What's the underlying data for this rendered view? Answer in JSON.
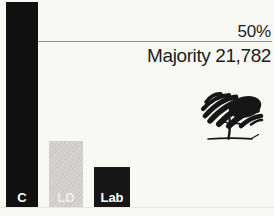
{
  "chart_data": {
    "type": "bar",
    "title": "",
    "categories": [
      "C",
      "LD",
      "Lab"
    ],
    "values_pct": [
      62,
      20,
      12
    ],
    "series_note": "share of vote estimated from bar heights vs 50% line",
    "threshold": {
      "value": 50,
      "label": "50%"
    },
    "annotation": "Majority 21,782",
    "bar_colors": [
      "#101010",
      "#d5d4d0",
      "#161616"
    ],
    "label_colors": [
      "#ffffff",
      "#f3f3f0",
      "#ffffff"
    ],
    "ylim": [
      0,
      65
    ],
    "grid": false,
    "legend": false,
    "background": "#f8f8f5",
    "logo": "conservative-tree-icon"
  }
}
